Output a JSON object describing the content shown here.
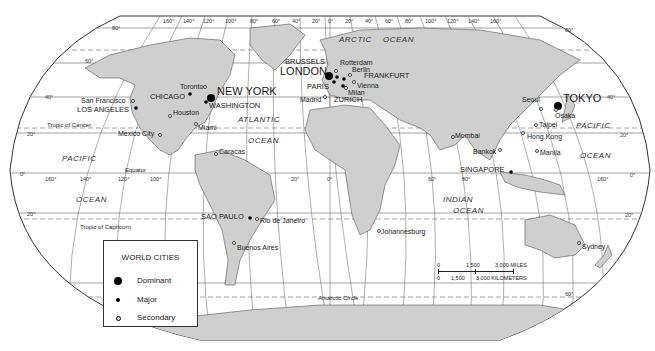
{
  "map": {
    "projection": "world-oval",
    "colors": {
      "land": "#cfcfcf",
      "water": "#ffffff",
      "lines": "#555555",
      "text": "#1a1a1a"
    },
    "top_longitude_ticks": [
      "160°",
      "140°",
      "120°",
      "100°",
      "80°",
      "60°",
      "40°",
      "20°",
      "0°",
      "20°",
      "40°",
      "60°",
      "80°",
      "100°",
      "120°",
      "140°",
      "160°"
    ],
    "latitude_ticks_left": [
      "80°",
      "60°",
      "40°",
      "20°",
      "0°",
      "20°"
    ],
    "latitude_ticks_right": [
      "80°",
      "40°",
      "20°",
      "0°",
      "20°",
      "60°"
    ],
    "equator_longitude_ticks": [
      "160°",
      "140°",
      "120°",
      "100°",
      "20°",
      "0°",
      "60°",
      "80°",
      "160°"
    ],
    "lines": {
      "tropic_cancer": "Tropic of Cancer",
      "equator": "Equator",
      "tropic_capricorn": "Tropic of Capricorn",
      "antarctic_circle": "Antarctic Circle"
    },
    "oceans": [
      {
        "name": "ARCTIC"
      },
      {
        "name": "OCEAN"
      },
      {
        "name": "ATLANTIC"
      },
      {
        "name": "OCEAN"
      },
      {
        "name": "PACIFIC"
      },
      {
        "name": "OCEAN"
      },
      {
        "name": "PACIFIC"
      },
      {
        "name": "OCEAN"
      },
      {
        "name": "INDIAN"
      },
      {
        "name": "OCEAN"
      }
    ],
    "cities": {
      "dominant": [
        "NEW YORK",
        "LONDON",
        "TOKYO"
      ],
      "major": [
        "CHICAGO",
        "LOS ANGELES",
        "WASHINGTON",
        "BRUSSELS",
        "PARIS",
        "FRANKFURT",
        "ZURICH",
        "SINGAPORE",
        "SAO PAULO"
      ],
      "secondary": [
        "San Francisco",
        "Toronto",
        "Houston",
        "Mexico City",
        "Miami",
        "Caracas",
        "Rio de Janeiro",
        "Buenos Aires",
        "Rotterdam",
        "Berlin",
        "Vienna",
        "Milan",
        "Madrid",
        "Johannesburg",
        "Mombai",
        "Bankok",
        "Seoul",
        "Osaka",
        "Taipei",
        "Hong Kong",
        "Manila",
        "Sydney"
      ]
    }
  },
  "legend": {
    "title": "WORLD CITIES",
    "items": [
      {
        "label": "Dominant",
        "symbol": "large-filled-dot"
      },
      {
        "label": "Major",
        "symbol": "small-filled-dot"
      },
      {
        "label": "Secondary",
        "symbol": "open-circle"
      }
    ]
  },
  "scale_bar": {
    "miles": {
      "labels": [
        "0",
        "1,500",
        "3,000 MILES"
      ]
    },
    "kilometers": {
      "labels": [
        "0",
        "1,500",
        "3,000 KILOMETERS"
      ]
    }
  }
}
